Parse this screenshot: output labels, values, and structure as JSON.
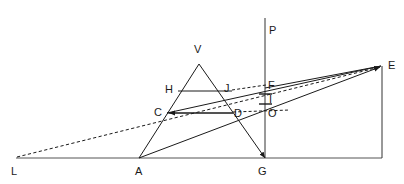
{
  "figure": {
    "background_color": "#ffffff",
    "stroke_color": "#1a1a1a",
    "label_color": "#1a1a1a",
    "width": 404,
    "height": 184,
    "points": {
      "L": {
        "label": "L",
        "x": 16,
        "y": 158,
        "label_x": 11,
        "label_y": 166
      },
      "A": {
        "label": "A",
        "x": 139,
        "y": 158,
        "label_x": 135,
        "label_y": 166
      },
      "G": {
        "label": "G",
        "x": 265,
        "y": 158,
        "label_x": 258,
        "label_y": 166
      },
      "E": {
        "label": "E",
        "x": 382,
        "y": 66,
        "label_x": 388,
        "label_y": 61
      },
      "V": {
        "label": "V",
        "x": 199,
        "y": 64,
        "label_x": 194,
        "label_y": 44
      },
      "P": {
        "label": "P",
        "x": 265,
        "y": 18,
        "label_x": 269,
        "label_y": 26
      },
      "H": {
        "label": "H",
        "x": 178,
        "y": 91,
        "label_x": 166,
        "label_y": 85
      },
      "J": {
        "label": "J",
        "x": 232,
        "y": 91,
        "label_x": 224,
        "label_y": 84
      },
      "F": {
        "label": "F",
        "x": 265,
        "y": 88,
        "label_x": 268,
        "label_y": 81
      },
      "I": {
        "label": "I",
        "x": 265,
        "y": 99,
        "label_x": 268,
        "label_y": 95
      },
      "C": {
        "label": "C",
        "x": 167,
        "y": 113,
        "label_x": 155,
        "label_y": 109
      },
      "D": {
        "label": "D",
        "x": 233,
        "y": 113,
        "label_x": 235,
        "label_y": 110
      },
      "O": {
        "label": "O",
        "x": 265,
        "y": 113,
        "label_x": 268,
        "label_y": 110
      }
    },
    "segments": [
      {
        "name": "baseline-L-G-foot",
        "from": "L",
        "to": "E-foot",
        "style": "solid"
      },
      {
        "name": "vertical-E-foot",
        "from": "E",
        "to": "E-foot",
        "style": "solid"
      },
      {
        "name": "vertical-P-G",
        "from": "P",
        "to": "G",
        "style": "solid"
      },
      {
        "name": "triangle-leg-A-V",
        "from": "A",
        "to": "V",
        "style": "solid"
      },
      {
        "name": "triangle-leg-V-G",
        "from": "V",
        "to": "G",
        "style": "solid"
      },
      {
        "name": "chord-H-J",
        "from": "H",
        "to": "J",
        "style": "solid"
      },
      {
        "name": "chord-C-D",
        "from": "C",
        "to": "D",
        "style": "solid"
      },
      {
        "name": "ray-C-to-E",
        "from": "C",
        "to": "E",
        "style": "solid"
      },
      {
        "name": "ray-F-to-E",
        "from": "F",
        "to": "E",
        "style": "solid"
      },
      {
        "name": "ray-A-to-E",
        "from": "A",
        "to": "E",
        "style": "solid"
      },
      {
        "name": "ray-L-to-E-dashed",
        "from": "L",
        "to": "E",
        "style": "dashed"
      },
      {
        "name": "chord-J-to-F-dashed",
        "from": "J",
        "to": "F",
        "style": "dashed"
      },
      {
        "name": "chord-D-to-O-dashed",
        "from": "D",
        "to": "O",
        "style": "dashed"
      }
    ],
    "tick_marks": [
      {
        "name": "tick-above-I",
        "x1": 259,
        "x2": 272,
        "y": 94
      },
      {
        "name": "tick-below-I",
        "x1": 259,
        "x2": 272,
        "y": 104
      }
    ],
    "arrowheads": [
      {
        "name": "arrowhead-at-E-from-L",
        "at": "E"
      },
      {
        "name": "arrowhead-at-E-from-A",
        "at": "E"
      },
      {
        "name": "arrowhead-at-C-from-D",
        "at": "C"
      },
      {
        "name": "arrowhead-at-G-from-V",
        "at": "G"
      }
    ]
  }
}
